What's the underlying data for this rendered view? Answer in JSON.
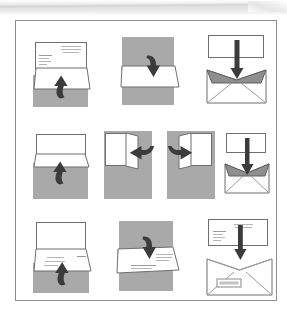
{
  "document": {
    "title": "Letter folding and envelope insertion instruction diagram",
    "alt_text": "Ten-step illustrated sequence showing a letter being folded in thirds, folded in half, and inserted into an envelope",
    "frame_border_color": "#8d8d8d",
    "page_background": "#ffffff"
  },
  "palette": {
    "paper_white": "#ffffff",
    "work_surface_gray": "#a9a9a9",
    "arrow_dark": "#3b3b3b",
    "envelope_flap_gray": "#8f8f8f",
    "outline_gray": "#6f6f6f",
    "text_line_gray": "#b6b6b6"
  },
  "diagram": {
    "columns": 3,
    "rows": 3,
    "total_steps": 10,
    "rows_data": [
      {
        "row_index": 1,
        "row_name": "first-fold-row",
        "steps": [
          {
            "step_number": 1,
            "name": "step-fold-bottom-up",
            "description": "Printed letter lying on gray surface, bottom third lifted upward",
            "arrow": "curved-up",
            "has_text_lines": true,
            "has_gray_surface": true
          },
          {
            "step_number": 2,
            "name": "step-fold-top-down",
            "description": "Top third of letter folded down over the bottom fold",
            "arrow": "curved-down",
            "has_text_lines": false,
            "has_gray_surface": true
          },
          {
            "step_number": 3,
            "name": "step-insert-into-envelope-thirds",
            "description": "Tri-folded letter pushed straight down into open envelope",
            "arrow": "straight-down",
            "has_text_lines": false,
            "has_gray_surface": false
          }
        ]
      },
      {
        "row_index": 2,
        "row_name": "half-fold-row",
        "steps": [
          {
            "step_number": 4,
            "name": "step-fold-half-up",
            "description": "Blank letter on gray surface, lower half folded up",
            "arrow": "curved-up",
            "has_text_lines": false,
            "has_gray_surface": true
          },
          {
            "step_number": 5,
            "name": "step-fold-left-panel",
            "description": "Half-folded sheet stood upright, right panel swung to the left",
            "arrow": "curved-left",
            "has_text_lines": false,
            "has_gray_surface": true
          },
          {
            "step_number": 6,
            "name": "step-fold-right-panel",
            "description": "Sheet with left panel swung to the right",
            "arrow": "curved-right",
            "has_text_lines": false,
            "has_gray_surface": true
          },
          {
            "step_number": 7,
            "name": "step-insert-into-envelope-half",
            "description": "Quarter-folded letter pushed straight down into open envelope",
            "arrow": "straight-down",
            "has_text_lines": false,
            "has_gray_surface": false
          }
        ]
      },
      {
        "row_index": 3,
        "row_name": "window-envelope-row",
        "steps": [
          {
            "step_number": 8,
            "name": "step-fold-printed-bottom-up",
            "description": "Printed letter with address block, bottom section folded upward",
            "arrow": "curved-up",
            "has_text_lines": true,
            "has_gray_surface": true
          },
          {
            "step_number": 9,
            "name": "step-fold-printed-top-down",
            "description": "Printed letter with top section folded down, address left showing",
            "arrow": "curved-down",
            "has_text_lines": true,
            "has_gray_surface": true
          },
          {
            "step_number": 10,
            "name": "step-insert-into-window-envelope",
            "description": "Folded letter inserted into window envelope so address shows through window",
            "arrow": "straight-down",
            "has_text_lines": true,
            "has_gray_surface": false,
            "has_address_window": true
          }
        ]
      }
    ]
  }
}
